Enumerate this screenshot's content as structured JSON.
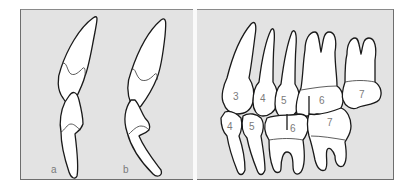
{
  "figure": {
    "left_panel": {
      "views": [
        {
          "label": "a"
        },
        {
          "label": "b"
        }
      ]
    },
    "right_panel": {
      "upper_teeth": [
        {
          "number": "3"
        },
        {
          "number": "4"
        },
        {
          "number": "5"
        },
        {
          "number": "6"
        },
        {
          "number": "7"
        }
      ],
      "lower_teeth": [
        {
          "number": "4"
        },
        {
          "number": "5"
        },
        {
          "number": "6"
        },
        {
          "number": "7"
        }
      ]
    }
  },
  "colors": {
    "panel_background": "#e3e3e3",
    "panel_border": "#6e6e6e",
    "tooth_fill": "#ffffff",
    "outline": "#1a1a1a",
    "label_text": "#7a7a7a"
  }
}
